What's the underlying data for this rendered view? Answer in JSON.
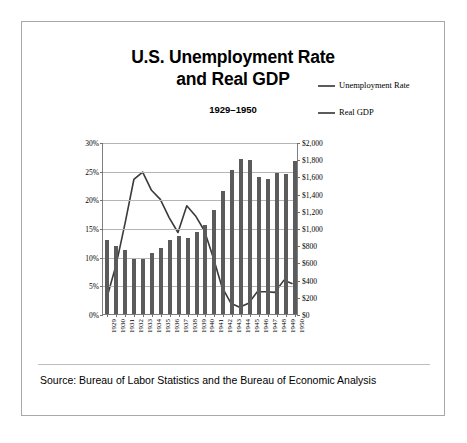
{
  "title_line1": "U.S. Unemployment Rate",
  "title_line2": "and Real GDP",
  "subtitle": "1929–1950",
  "source": "Source: Bureau of Labor Statistics and the Bureau of Economic Analysis",
  "legend": {
    "items": [
      {
        "label": "Unemployment Rate",
        "color": "#5b5b5b"
      },
      {
        "label": "Real GDP",
        "color": "#5b5b5b"
      }
    ]
  },
  "colors": {
    "bar": "#5b5b5b",
    "line": "#3a3a3a",
    "gridline": "#b5b5b5",
    "axis": "#808080",
    "frame": "#a8a8a8",
    "divider": "#bdbdbd",
    "text": "#000000"
  },
  "chart_data": {
    "type": "bar",
    "title": "U.S. Unemployment Rate and Real GDP",
    "subtitle": "1929–1950",
    "xlabel": "",
    "ylabel": "",
    "grid": true,
    "legend_position": "right",
    "categories": [
      "1929",
      "1930",
      "1931",
      "1932",
      "1933",
      "1934",
      "1935",
      "1936",
      "1937",
      "1938",
      "1939",
      "1940",
      "1941",
      "1942",
      "1943",
      "1944",
      "1945",
      "1946",
      "1947",
      "1948",
      "1949",
      "1950"
    ],
    "left_axis": {
      "label": "Unemployment Rate",
      "ylim": [
        0,
        30
      ],
      "tick_step": 5,
      "ticks": [
        "0%",
        "5%",
        "10%",
        "15%",
        "20%",
        "25%",
        "30%"
      ],
      "unit": "percent"
    },
    "right_axis": {
      "label": "Real GDP",
      "ylim": [
        0,
        2000
      ],
      "tick_step": 200,
      "ticks": [
        "$0",
        "$200",
        "$400",
        "$600",
        "$800",
        "$1,000",
        "$1,200",
        "$1,400",
        "$1,600",
        "$1,800",
        "$2,000"
      ],
      "unit": "billions of dollars"
    },
    "series": [
      {
        "name": "Real GDP",
        "type": "bar",
        "axis": "right",
        "color": "#5b5b5b",
        "values": [
          865,
          790,
          740,
          643,
          635,
          704,
          766,
          866,
          911,
          879,
          950,
          1034,
          1211,
          1436,
          1670,
          1806,
          1786,
          1590,
          1575,
          1641,
          1632,
          1777
        ]
      },
      {
        "name": "Unemployment Rate",
        "type": "line",
        "axis": "left",
        "color": "#3a3a3a",
        "values": [
          3.2,
          8.7,
          15.9,
          23.6,
          24.9,
          21.7,
          20.1,
          16.9,
          14.3,
          19.0,
          17.2,
          14.6,
          9.9,
          4.7,
          1.9,
          1.2,
          1.9,
          3.9,
          3.9,
          3.8,
          5.9,
          5.3
        ]
      }
    ]
  }
}
